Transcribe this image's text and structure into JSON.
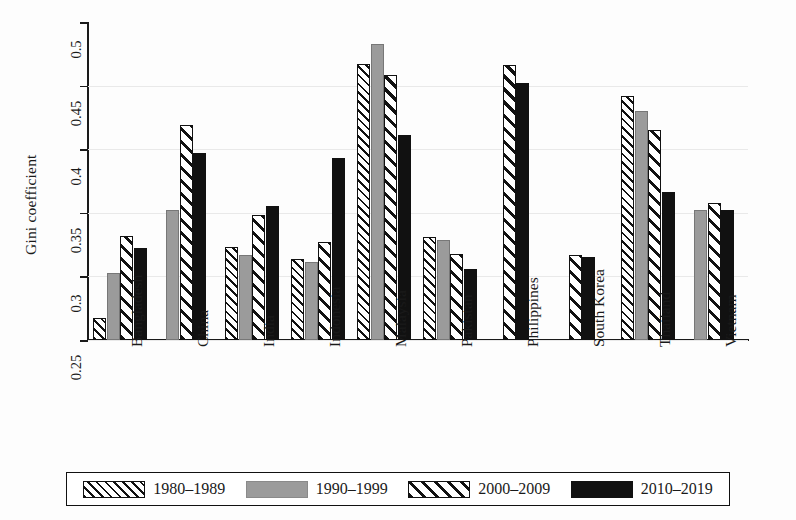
{
  "chart_data": {
    "type": "bar",
    "title": "",
    "xlabel": "",
    "ylabel": "Gini coefficient",
    "ylim": [
      0.25,
      0.5
    ],
    "yticks": [
      "0.25",
      "0.3",
      "0.35",
      "0.4",
      "0.45",
      "0.5"
    ],
    "grid": true,
    "legend_position": "bottom",
    "categories": [
      "Bangladesh",
      "China",
      "India",
      "Indonesia",
      "Malaysia",
      "Pakistan",
      "Philippines",
      "South Korea",
      "Thailand",
      "Vietnam"
    ],
    "series": [
      {
        "name": "1980–1989",
        "pattern": "fine-hatch",
        "values": [
          0.267,
          null,
          0.323,
          0.314,
          0.467,
          0.331,
          null,
          null,
          0.442,
          null
        ]
      },
      {
        "name": "1990–1999",
        "pattern": "solid-gray",
        "values": [
          0.303,
          0.352,
          0.317,
          0.311,
          0.483,
          0.329,
          null,
          null,
          0.43,
          0.352
        ]
      },
      {
        "name": "2000–2009",
        "pattern": "bold-hatch",
        "values": [
          0.332,
          0.419,
          0.348,
          0.327,
          0.458,
          0.318,
          0.466,
          0.317,
          0.415,
          0.358
        ]
      },
      {
        "name": "2010–2019",
        "pattern": "solid-black",
        "values": [
          0.322,
          0.397,
          0.355,
          0.393,
          0.411,
          0.306,
          0.452,
          0.315,
          0.366,
          0.352
        ]
      }
    ]
  },
  "legend": {
    "items": [
      {
        "label": "1980–1989"
      },
      {
        "label": "1990–1999"
      },
      {
        "label": "2000–2009"
      },
      {
        "label": "2010–2019"
      }
    ]
  },
  "colors": {
    "axis": "#111111",
    "gray_series": "#9b9b9b",
    "black_series": "#111111",
    "gridline": "#e9e9e9",
    "background": "#ffffff"
  }
}
